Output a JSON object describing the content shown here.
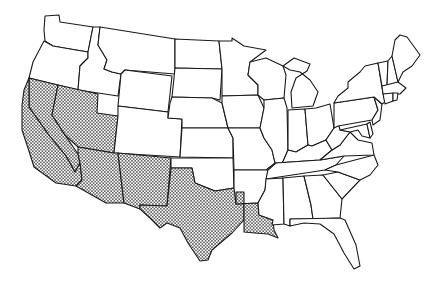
{
  "map": {
    "title": "Contiguous United States",
    "background": "#ffffff",
    "stroke_color": "#1a1a1a",
    "pattern": "stippled-dots",
    "shaded_states": [
      "California",
      "Nevada",
      "Utah",
      "Arizona",
      "New Mexico",
      "Texas",
      "Louisiana"
    ],
    "unshaded_states": [
      "Washington",
      "Oregon",
      "Idaho",
      "Montana",
      "Wyoming",
      "Colorado",
      "North Dakota",
      "South Dakota",
      "Nebraska",
      "Kansas",
      "Oklahoma",
      "Minnesota",
      "Iowa",
      "Missouri",
      "Arkansas",
      "Wisconsin",
      "Illinois",
      "Michigan",
      "Indiana",
      "Ohio",
      "Kentucky",
      "Tennessee",
      "Mississippi",
      "Alabama",
      "Georgia",
      "Florida",
      "South Carolina",
      "North Carolina",
      "Virginia",
      "West Virginia",
      "Maryland",
      "Delaware",
      "Pennsylvania",
      "New Jersey",
      "New York",
      "Connecticut",
      "Rhode Island",
      "Massachusetts",
      "Vermont",
      "New Hampshire",
      "Maine"
    ]
  }
}
